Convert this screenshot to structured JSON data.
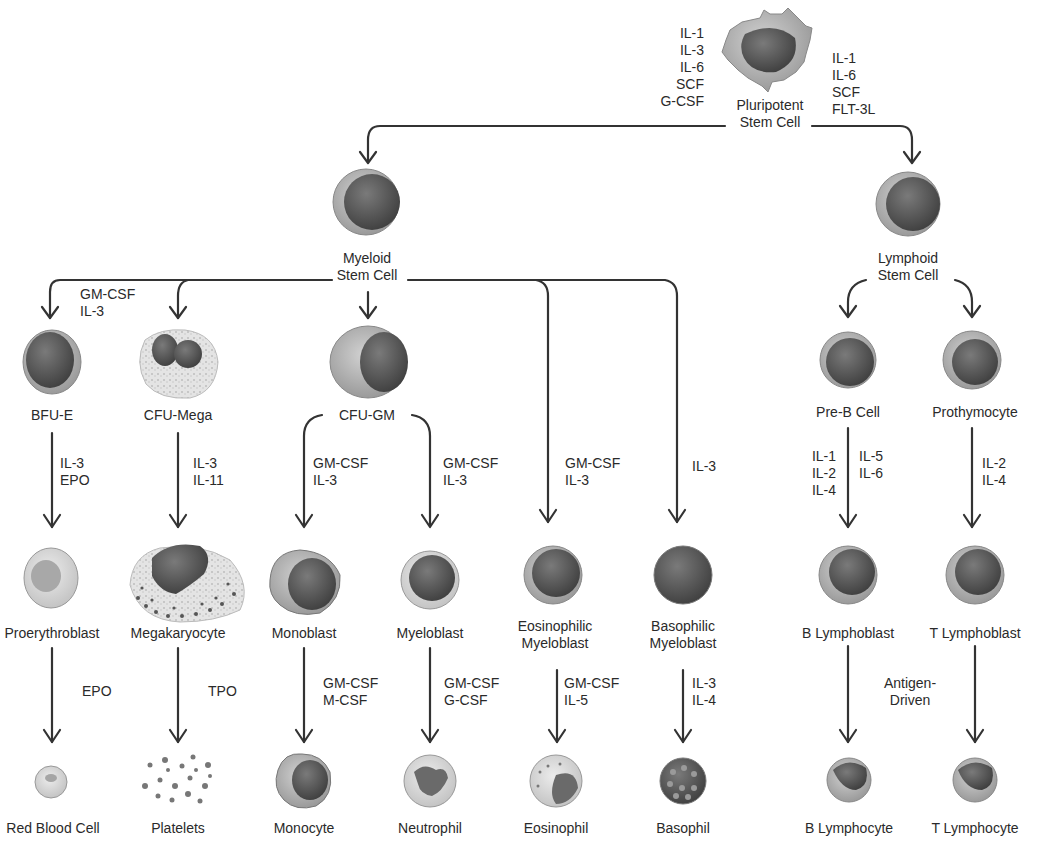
{
  "diagram": {
    "colors": {
      "line": "#333333",
      "cytoplasm": "#b5b5b5",
      "nucleus": "#555555",
      "pale": "#d8d8d8"
    },
    "nodes": {
      "pluripotent": {
        "line1": "Pluripotent",
        "line2": "Stem Cell"
      },
      "myeloid": {
        "line1": "Myeloid",
        "line2": "Stem Cell"
      },
      "lymphoid": {
        "line1": "Lymphoid",
        "line2": "Stem Cell"
      },
      "bfue": {
        "label": "BFU-E"
      },
      "cfumega": {
        "label": "CFU-Mega"
      },
      "cfugm": {
        "label": "CFU-GM"
      },
      "preb": {
        "label": "Pre-B Cell"
      },
      "prothymocyte": {
        "label": "Prothymocyte"
      },
      "proerythroblast": {
        "label": "Proerythroblast"
      },
      "megakaryocyte": {
        "label": "Megakaryocyte"
      },
      "monoblast": {
        "label": "Monoblast"
      },
      "myeloblast": {
        "label": "Myeloblast"
      },
      "eosmyeloblast": {
        "line1": "Eosinophilic",
        "line2": "Myeloblast"
      },
      "basomyeloblast": {
        "line1": "Basophilic",
        "line2": "Myeloblast"
      },
      "blymphoblast": {
        "label": "B Lymphoblast"
      },
      "tlymphoblast": {
        "label": "T Lymphoblast"
      },
      "rbc": {
        "label": "Red Blood Cell"
      },
      "platelets": {
        "label": "Platelets"
      },
      "monocyte": {
        "label": "Monocyte"
      },
      "neutrophil": {
        "label": "Neutrophil"
      },
      "eosinophil": {
        "label": "Eosinophil"
      },
      "basophil": {
        "label": "Basophil"
      },
      "blymphocyte": {
        "label": "B Lymphocyte"
      },
      "tlymphocyte": {
        "label": "T Lymphocyte"
      }
    },
    "factors": {
      "to_myeloid": [
        "IL-1",
        "IL-3",
        "IL-6",
        "SCF",
        "G-CSF"
      ],
      "to_lymphoid": [
        "IL-1",
        "IL-6",
        "SCF",
        "FLT-3L"
      ],
      "to_bfue_mega": [
        "GM-CSF",
        "IL-3"
      ],
      "to_proerythroblast": [
        "IL-3",
        "EPO"
      ],
      "to_megakaryocyte": [
        "IL-3",
        "IL-11"
      ],
      "to_monoblast": [
        "GM-CSF",
        "IL-3"
      ],
      "to_myeloblast": [
        "GM-CSF",
        "IL-3"
      ],
      "to_eosmyeloblast": [
        "GM-CSF",
        "IL-3"
      ],
      "to_basomyeloblast": [
        "IL-3"
      ],
      "to_blymphoblast_left": [
        "IL-1",
        "IL-2",
        "IL-4"
      ],
      "to_blymphoblast_right": [
        "IL-5",
        "IL-6"
      ],
      "to_tlymphoblast": [
        "IL-2",
        "IL-4"
      ],
      "to_rbc": [
        "EPO"
      ],
      "to_platelets": [
        "TPO"
      ],
      "to_monocyte": [
        "GM-CSF",
        "M-CSF"
      ],
      "to_neutrophil": [
        "GM-CSF",
        "G-CSF"
      ],
      "to_eosinophil": [
        "GM-CSF",
        "IL-5"
      ],
      "to_basophil": [
        "IL-3",
        "IL-4"
      ],
      "to_lymphocytes": [
        "Antigen-",
        "Driven"
      ]
    }
  }
}
